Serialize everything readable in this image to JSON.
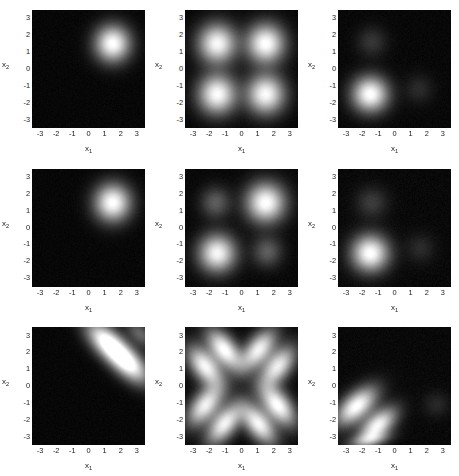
{
  "figure": {
    "layout": {
      "rows": 3,
      "cols": 3
    },
    "axis": {
      "xlabel": "x",
      "xlabel_sub": "1",
      "ylabel": "x",
      "ylabel_sub": "2",
      "xticks": [
        "-3",
        "-2",
        "-1",
        "0",
        "1",
        "2",
        "3"
      ],
      "yticks": [
        "3",
        "2",
        "1",
        "0",
        "-1",
        "-2",
        "-3"
      ],
      "xlim": [
        -3.5,
        3.5
      ],
      "ylim": [
        -3.5,
        3.5
      ]
    },
    "colors": {
      "background": "#ffffff",
      "plot_background": "#000000",
      "colormap_low": "#000000",
      "colormap_high": "#ffffff",
      "tick_color": "#1a1a1a"
    }
  },
  "chart_data": [
    {
      "index": 0,
      "row": 0,
      "col": 0,
      "type": "heatmap",
      "title": "",
      "xlabel": "x1",
      "ylabel": "x2",
      "xlim": [
        -3.5,
        3.5
      ],
      "ylim": [
        -3.5,
        3.5
      ],
      "colormap": "gray",
      "noise": 0.035,
      "blobs": [
        {
          "cx": 1.5,
          "cy": 1.5,
          "sx": 0.72,
          "sy": 0.72,
          "rot": 0,
          "amp": 1.0
        }
      ]
    },
    {
      "index": 1,
      "row": 0,
      "col": 1,
      "type": "heatmap",
      "title": "",
      "xlabel": "x1",
      "ylabel": "x2",
      "xlim": [
        -3.5,
        3.5
      ],
      "ylim": [
        -3.5,
        3.5
      ],
      "colormap": "gray",
      "noise": 0.035,
      "blobs": [
        {
          "cx": -1.5,
          "cy": 1.5,
          "sx": 0.78,
          "sy": 0.78,
          "rot": 0,
          "amp": 0.96
        },
        {
          "cx": 1.5,
          "cy": 1.5,
          "sx": 0.78,
          "sy": 0.78,
          "rot": 0,
          "amp": 1.0
        },
        {
          "cx": -1.5,
          "cy": -1.5,
          "sx": 0.78,
          "sy": 0.78,
          "rot": 0,
          "amp": 0.98
        },
        {
          "cx": 1.5,
          "cy": -1.5,
          "sx": 0.78,
          "sy": 0.78,
          "rot": 0,
          "amp": 0.97
        }
      ]
    },
    {
      "index": 2,
      "row": 0,
      "col": 2,
      "type": "heatmap",
      "title": "",
      "xlabel": "x1",
      "ylabel": "x2",
      "xlim": [
        -3.5,
        3.5
      ],
      "ylim": [
        -3.5,
        3.5
      ],
      "colormap": "gray",
      "noise": 0.04,
      "blobs": [
        {
          "cx": -1.5,
          "cy": -1.5,
          "sx": 0.74,
          "sy": 0.7,
          "rot": 0,
          "amp": 1.0
        },
        {
          "cx": -1.4,
          "cy": 1.6,
          "sx": 0.62,
          "sy": 0.6,
          "rot": 0,
          "amp": 0.15
        },
        {
          "cx": 1.5,
          "cy": -1.2,
          "sx": 0.6,
          "sy": 0.58,
          "rot": 0,
          "amp": 0.11
        }
      ]
    },
    {
      "index": 3,
      "row": 1,
      "col": 0,
      "type": "heatmap",
      "title": "",
      "xlabel": "x1",
      "ylabel": "x2",
      "xlim": [
        -3.5,
        3.5
      ],
      "ylim": [
        -3.5,
        3.5
      ],
      "colormap": "gray",
      "noise": 0.035,
      "blobs": [
        {
          "cx": 1.5,
          "cy": 1.5,
          "sx": 0.74,
          "sy": 0.74,
          "rot": 0,
          "amp": 1.0
        }
      ]
    },
    {
      "index": 4,
      "row": 1,
      "col": 1,
      "type": "heatmap",
      "title": "",
      "xlabel": "x1",
      "ylabel": "x2",
      "xlim": [
        -3.5,
        3.5
      ],
      "ylim": [
        -3.5,
        3.5
      ],
      "colormap": "gray",
      "noise": 0.04,
      "blobs": [
        {
          "cx": 1.5,
          "cy": 1.5,
          "sx": 0.8,
          "sy": 0.78,
          "rot": 0,
          "amp": 1.0
        },
        {
          "cx": -1.5,
          "cy": -1.5,
          "sx": 0.76,
          "sy": 0.74,
          "rot": 0,
          "amp": 0.95
        },
        {
          "cx": -1.6,
          "cy": 1.5,
          "sx": 0.62,
          "sy": 0.62,
          "rot": 0,
          "amp": 0.3
        },
        {
          "cx": 1.6,
          "cy": -1.4,
          "sx": 0.62,
          "sy": 0.62,
          "rot": 0,
          "amp": 0.3
        }
      ]
    },
    {
      "index": 5,
      "row": 1,
      "col": 2,
      "type": "heatmap",
      "title": "",
      "xlabel": "x1",
      "ylabel": "x2",
      "xlim": [
        -3.5,
        3.5
      ],
      "ylim": [
        -3.5,
        3.5
      ],
      "colormap": "gray",
      "noise": 0.045,
      "blobs": [
        {
          "cx": -1.5,
          "cy": -1.5,
          "sx": 0.76,
          "sy": 0.72,
          "rot": 0,
          "amp": 1.0
        },
        {
          "cx": -1.4,
          "cy": 1.5,
          "sx": 0.66,
          "sy": 0.62,
          "rot": 0,
          "amp": 0.17
        },
        {
          "cx": 1.6,
          "cy": -1.2,
          "sx": 0.6,
          "sy": 0.58,
          "rot": 0,
          "amp": 0.11
        }
      ]
    },
    {
      "index": 6,
      "row": 2,
      "col": 0,
      "type": "heatmap",
      "title": "",
      "xlabel": "x1",
      "ylabel": "x2",
      "xlim": [
        -3.5,
        3.5
      ],
      "ylim": [
        -3.5,
        3.5
      ],
      "colormap": "gray",
      "noise": 0.035,
      "blobs": [
        {
          "cx": 1.15,
          "cy": 2.6,
          "sx": 1.05,
          "sy": 0.52,
          "rot": -42,
          "amp": 1.0
        },
        {
          "cx": 2.45,
          "cy": 1.35,
          "sx": 1.05,
          "sy": 0.52,
          "rot": -42,
          "amp": 1.0
        },
        {
          "cx": 3.2,
          "cy": 3.1,
          "sx": 0.7,
          "sy": 0.4,
          "rot": -42,
          "amp": 0.33
        }
      ]
    },
    {
      "index": 7,
      "row": 2,
      "col": 1,
      "type": "heatmap",
      "title": "",
      "xlabel": "x1",
      "ylabel": "x2",
      "xlim": [
        -3.5,
        3.5
      ],
      "ylim": [
        -3.5,
        3.5
      ],
      "colormap": "gray",
      "noise": 0.04,
      "blobs": [
        {
          "cx": -1.05,
          "cy": 2.15,
          "sx": 0.95,
          "sy": 0.5,
          "rot": -50,
          "amp": 1.0
        },
        {
          "cx": 1.05,
          "cy": 2.15,
          "sx": 0.95,
          "sy": 0.5,
          "rot": 50,
          "amp": 0.93
        },
        {
          "cx": -2.25,
          "cy": 1.15,
          "sx": 0.95,
          "sy": 0.52,
          "rot": -50,
          "amp": 0.95
        },
        {
          "cx": 2.25,
          "cy": 1.15,
          "sx": 0.95,
          "sy": 0.52,
          "rot": 50,
          "amp": 0.9
        },
        {
          "cx": -2.25,
          "cy": -1.15,
          "sx": 0.95,
          "sy": 0.52,
          "rot": 50,
          "amp": 0.92
        },
        {
          "cx": 2.25,
          "cy": -1.15,
          "sx": 0.95,
          "sy": 0.52,
          "rot": -50,
          "amp": 1.0
        },
        {
          "cx": -1.05,
          "cy": -2.25,
          "sx": 0.95,
          "sy": 0.5,
          "rot": 50,
          "amp": 0.93
        },
        {
          "cx": 1.05,
          "cy": -2.25,
          "sx": 0.95,
          "sy": 0.5,
          "rot": -50,
          "amp": 0.95
        }
      ]
    },
    {
      "index": 8,
      "row": 2,
      "col": 2,
      "type": "heatmap",
      "title": "",
      "xlabel": "x1",
      "ylabel": "x2",
      "xlim": [
        -3.5,
        3.5
      ],
      "ylim": [
        -3.5,
        3.5
      ],
      "colormap": "gray",
      "noise": 0.045,
      "blobs": [
        {
          "cx": -2.35,
          "cy": -1.2,
          "sx": 1.0,
          "sy": 0.52,
          "rot": 40,
          "amp": 1.0
        },
        {
          "cx": -1.05,
          "cy": -2.35,
          "sx": 0.92,
          "sy": 0.48,
          "rot": 40,
          "amp": 0.95
        },
        {
          "cx": -1.55,
          "cy": -3.2,
          "sx": 0.85,
          "sy": 0.28,
          "rot": 10,
          "amp": 0.42
        },
        {
          "cx": 2.6,
          "cy": -1.1,
          "sx": 0.55,
          "sy": 0.5,
          "rot": 0,
          "amp": 0.1
        }
      ]
    }
  ]
}
